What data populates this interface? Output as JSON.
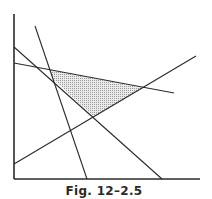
{
  "figure": {
    "caption": "Fig. 12–2.5",
    "colors": {
      "line": "#2a2a2a",
      "shade": "#d6d6d6",
      "background": "#ffffff"
    },
    "axes": {
      "y_axis": {
        "x1": 14,
        "y1": 14,
        "x2": 14,
        "y2": 179
      },
      "x_axis": {
        "x1": 14,
        "y1": 179,
        "x2": 200,
        "y2": 179
      }
    },
    "lines": [
      {
        "name": "steep-line",
        "x1": 35,
        "y1": 26,
        "x2": 87,
        "y2": 179
      },
      {
        "name": "diagonal-line",
        "x1": 14,
        "y1": 47,
        "x2": 162,
        "y2": 179
      },
      {
        "name": "shallow-line",
        "x1": 14,
        "y1": 63,
        "x2": 174,
        "y2": 93
      },
      {
        "name": "rising-line",
        "x1": 14,
        "y1": 164,
        "x2": 196,
        "y2": 56
      }
    ],
    "feasible_region": {
      "points": "50,70 143,88 94,117 53,79"
    }
  }
}
